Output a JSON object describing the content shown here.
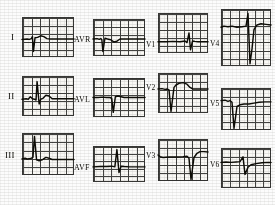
{
  "document": {
    "kind": "12-lead electrocardiogram",
    "rows": 3,
    "columns": 4,
    "paper_color": "#f3f2ef",
    "grid_color": "#3a3a38",
    "trace_color": "#16150f"
  },
  "leads": [
    {
      "name": "lead-I",
      "label": "I",
      "label_class": "limb",
      "label_side": "left",
      "panel": {
        "x": 22,
        "y": 17,
        "w": 52,
        "h": 40
      },
      "label_pos": {
        "x": 11,
        "y": 33
      },
      "grid": {
        "cell_w": 8.6,
        "cell_h": 8.0
      },
      "baseline_pct": 56,
      "morphology": "small r, deep narrow S, low flat T",
      "path": "M0,56 L10,55 L14,56 L18,54 L20,49 L22,86 L25,52 L30,51 L36,47 L42,49 L48,54 L54,55 L62,55 L76,55 L100,55"
    },
    {
      "name": "lead-II",
      "label": "II",
      "label_class": "limb",
      "label_side": "left",
      "panel": {
        "x": 22,
        "y": 76,
        "w": 52,
        "h": 40
      },
      "label_pos": {
        "x": 8,
        "y": 92
      },
      "grid": {
        "cell_w": 8.6,
        "cell_h": 8.0
      },
      "baseline_pct": 58,
      "morphology": "tall upright R wave, small T",
      "path": "M0,58 L8,57 L12,58 L16,52 L20,57 L24,58 L27,60 L29,14 L33,70 L36,58 L40,56 L46,48 L52,50 L58,57 L66,57 L80,57 L100,57"
    },
    {
      "name": "lead-III",
      "label": "III",
      "label_class": "limb",
      "label_side": "left",
      "panel": {
        "x": 22,
        "y": 133,
        "w": 52,
        "h": 42
      },
      "label_pos": {
        "x": 5,
        "y": 151
      },
      "grid": {
        "cell_w": 8.6,
        "cell_h": 8.3
      },
      "baseline_pct": 62,
      "morphology": "tall narrow R, slurred downslope, small T",
      "path": "M0,62 L6,60 L10,62 L14,61 L18,60 L21,58 L24,8 L28,64 L33,66 L40,63 L46,58 L52,60 L58,63 L66,63 L82,63 L100,63"
    },
    {
      "name": "lead-aVR",
      "label": "AVR",
      "label_class": "aug",
      "label_side": "left",
      "panel": {
        "x": 93,
        "y": 19,
        "w": 52,
        "h": 37
      },
      "label_pos": {
        "x": 74,
        "y": 36
      },
      "grid": {
        "cell_w": 8.6,
        "cell_h": 7.4
      },
      "baseline_pct": 54,
      "morphology": "negative QS complex, inverted low T",
      "path": "M0,54 L8,53 L12,55 L15,53 L17,56 L19,88 L23,52 L28,54 L34,56 L40,62 L46,60 L52,54 L62,54 L78,54 L100,54"
    },
    {
      "name": "lead-aVL",
      "label": "AVL",
      "label_class": "aug",
      "label_side": "left",
      "panel": {
        "x": 93,
        "y": 78,
        "w": 52,
        "h": 39
      },
      "label_pos": {
        "x": 74,
        "y": 96
      },
      "grid": {
        "cell_w": 8.6,
        "cell_h": 7.8
      },
      "baseline_pct": 50,
      "morphology": "flat baseline with deep narrow QS dip",
      "path": "M0,50 L10,50 L18,49 L26,50 L32,50 L36,52 L39,88 L43,48 L48,46 L54,48 L60,50 L70,50 L84,50 L100,50"
    },
    {
      "name": "lead-aVF",
      "label": "AVF",
      "label_class": "aug",
      "label_side": "left",
      "panel": {
        "x": 93,
        "y": 146,
        "w": 52,
        "h": 36
      },
      "label_pos": {
        "x": 74,
        "y": 164
      },
      "grid": {
        "cell_w": 8.6,
        "cell_h": 7.2
      },
      "baseline_pct": 58,
      "morphology": "tall spiked R wave, flat baseline",
      "path": "M0,58 L14,57 L26,57 L36,56 L42,58 L46,10 L50,74 L54,56 L60,57 L70,58 L84,58 L100,58"
    },
    {
      "name": "lead-V1",
      "label": "V1",
      "label_class": "prec",
      "label_side": "left",
      "panel": {
        "x": 158,
        "y": 13,
        "w": 50,
        "h": 40
      },
      "label_pos": {
        "x": 146,
        "y": 41
      },
      "grid": {
        "cell_w": 8.3,
        "cell_h": 8.0
      },
      "baseline_pct": 72,
      "morphology": "tiny rS complex, near-isoelectric",
      "path": "M0,72 L16,72 L30,71 L44,72 L54,70 L58,74 L62,50 L65,92 L69,70 L74,71 L80,72 L90,72 L100,72"
    },
    {
      "name": "lead-V2",
      "label": "V2",
      "label_class": "prec",
      "label_side": "left",
      "panel": {
        "x": 158,
        "y": 73,
        "w": 50,
        "h": 40
      },
      "label_pos": {
        "x": 146,
        "y": 84
      },
      "grid": {
        "cell_w": 8.3,
        "cell_h": 8.0
      },
      "baseline_pct": 40,
      "morphology": "deep QS complex, rounded positive T",
      "path": "M0,40 L8,39 L14,41 L18,40 L22,42 L26,96 L32,36 L36,30 L42,26 L50,24 L58,28 L64,36 L70,40 L80,40 L100,40"
    },
    {
      "name": "lead-V3",
      "label": "V3",
      "label_class": "prec",
      "label_side": "left",
      "panel": {
        "x": 158,
        "y": 139,
        "w": 50,
        "h": 42
      },
      "label_pos": {
        "x": 146,
        "y": 152
      },
      "grid": {
        "cell_w": 8.3,
        "cell_h": 8.3
      },
      "baseline_pct": 42,
      "morphology": "flat baseline, deep narrow S, rising T",
      "path": "M0,38 L4,42 L10,44 L22,43 L36,43 L50,42 L58,41 L62,46 L66,96 L72,44 L78,34 L84,30 L92,30 L100,31"
    },
    {
      "name": "lead-V4",
      "label": "V4",
      "label_class": "prec",
      "label_side": "left",
      "panel": {
        "x": 221,
        "y": 9,
        "w": 50,
        "h": 57
      },
      "label_pos": {
        "x": 210,
        "y": 40
      },
      "grid": {
        "cell_w": 8.3,
        "cell_h": 8.1
      },
      "baseline_pct": 34,
      "morphology": "tall R wave, very deep S, recovering T",
      "path": "M0,32 L6,30 L14,31 L22,30 L32,32 L42,31 L50,30 L54,8 L58,96 L62,70 L66,36 L72,28 L80,26 L90,27 L100,28"
    },
    {
      "name": "lead-V5",
      "label": "V5",
      "label_class": "prec",
      "label_side": "left",
      "panel": {
        "x": 221,
        "y": 88,
        "w": 50,
        "h": 42
      },
      "label_pos": {
        "x": 210,
        "y": 100
      },
      "grid": {
        "cell_w": 8.3,
        "cell_h": 8.3
      },
      "baseline_pct": 34,
      "morphology": "narrow deep QS, slow return to baseline",
      "path": "M0,30 L8,29 L14,32 L18,30 L22,34 L26,96 L32,44 L38,40 L46,38 L56,38 L66,36 L76,34 L88,33 L100,33"
    },
    {
      "name": "lead-V6",
      "label": "V6",
      "label_class": "prec",
      "label_side": "left",
      "panel": {
        "x": 221,
        "y": 148,
        "w": 50,
        "h": 40
      },
      "label_pos": {
        "x": 210,
        "y": 161
      },
      "grid": {
        "cell_w": 8.3,
        "cell_h": 8.0
      },
      "baseline_pct": 36,
      "morphology": "low flat baseline with modest negative deflection",
      "path": "M0,36 L10,35 L20,36 L30,35 L38,34 L44,22 L48,66 L54,48 L60,42 L70,39 L82,37 L92,36 L100,36"
    }
  ]
}
